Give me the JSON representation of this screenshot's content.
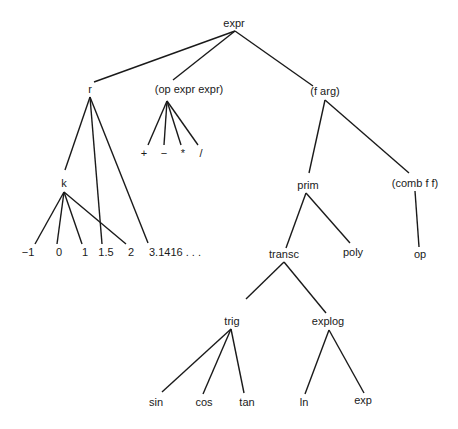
{
  "diagram": {
    "type": "tree",
    "nodes": [
      {
        "id": "expr",
        "label": "expr",
        "x": 234,
        "y": 27
      },
      {
        "id": "r",
        "label": "r",
        "x": 90,
        "y": 93
      },
      {
        "id": "opexpr",
        "label": "(op expr expr)",
        "x": 189,
        "y": 93
      },
      {
        "id": "farg",
        "label": "(f arg)",
        "x": 325,
        "y": 95
      },
      {
        "id": "plus",
        "label": "+",
        "x": 144,
        "y": 157
      },
      {
        "id": "minus",
        "label": "−",
        "x": 164,
        "y": 157
      },
      {
        "id": "times",
        "label": "*",
        "x": 183,
        "y": 157
      },
      {
        "id": "div",
        "label": "/",
        "x": 201,
        "y": 157
      },
      {
        "id": "k",
        "label": "k",
        "x": 64,
        "y": 187
      },
      {
        "id": "prim",
        "label": "prim",
        "x": 308,
        "y": 189
      },
      {
        "id": "combff",
        "label": "(comb f f)",
        "x": 415,
        "y": 187
      },
      {
        "id": "n_m1",
        "label": "−1",
        "x": 28,
        "y": 256
      },
      {
        "id": "n_0",
        "label": "0",
        "x": 59,
        "y": 256
      },
      {
        "id": "n_1",
        "label": "1",
        "x": 85,
        "y": 256
      },
      {
        "id": "n_15",
        "label": "1.5",
        "x": 106,
        "y": 256
      },
      {
        "id": "n_2",
        "label": "2",
        "x": 131,
        "y": 256
      },
      {
        "id": "n_pi",
        "label": "3.1416 . . .",
        "x": 175,
        "y": 256
      },
      {
        "id": "transc",
        "label": "transc",
        "x": 284,
        "y": 258
      },
      {
        "id": "poly",
        "label": "poly",
        "x": 353,
        "y": 256
      },
      {
        "id": "op",
        "label": "op",
        "x": 420,
        "y": 258
      },
      {
        "id": "trig",
        "label": "trig",
        "x": 232,
        "y": 325
      },
      {
        "id": "explog",
        "label": "explog",
        "x": 328,
        "y": 325
      },
      {
        "id": "sin",
        "label": "sin",
        "x": 156,
        "y": 406
      },
      {
        "id": "cos",
        "label": "cos",
        "x": 204,
        "y": 406
      },
      {
        "id": "tan",
        "label": "tan",
        "x": 247,
        "y": 406
      },
      {
        "id": "ln",
        "label": "ln",
        "x": 304,
        "y": 406
      },
      {
        "id": "exp",
        "label": "exp",
        "x": 363,
        "y": 404
      }
    ],
    "edges": [
      {
        "x1": 235,
        "y1": 31,
        "x2": 94,
        "y2": 82
      },
      {
        "x1": 235,
        "y1": 31,
        "x2": 173,
        "y2": 80
      },
      {
        "x1": 235,
        "y1": 31,
        "x2": 313,
        "y2": 86
      },
      {
        "x1": 90,
        "y1": 97,
        "x2": 65,
        "y2": 170
      },
      {
        "x1": 90,
        "y1": 97,
        "x2": 102,
        "y2": 244
      },
      {
        "x1": 90,
        "y1": 97,
        "x2": 148,
        "y2": 243
      },
      {
        "x1": 167,
        "y1": 101,
        "x2": 148,
        "y2": 145
      },
      {
        "x1": 167,
        "y1": 101,
        "x2": 164,
        "y2": 145
      },
      {
        "x1": 167,
        "y1": 101,
        "x2": 181,
        "y2": 145
      },
      {
        "x1": 167,
        "y1": 101,
        "x2": 198,
        "y2": 145
      },
      {
        "x1": 325,
        "y1": 100,
        "x2": 309,
        "y2": 173
      },
      {
        "x1": 325,
        "y1": 100,
        "x2": 409,
        "y2": 173
      },
      {
        "x1": 64,
        "y1": 192,
        "x2": 35,
        "y2": 244
      },
      {
        "x1": 64,
        "y1": 192,
        "x2": 57,
        "y2": 244
      },
      {
        "x1": 64,
        "y1": 192,
        "x2": 82,
        "y2": 244
      },
      {
        "x1": 64,
        "y1": 192,
        "x2": 126,
        "y2": 244
      },
      {
        "x1": 306,
        "y1": 193,
        "x2": 286,
        "y2": 248
      },
      {
        "x1": 306,
        "y1": 193,
        "x2": 350,
        "y2": 243
      },
      {
        "x1": 415,
        "y1": 191,
        "x2": 419,
        "y2": 247
      },
      {
        "x1": 284,
        "y1": 262,
        "x2": 246,
        "y2": 299
      },
      {
        "x1": 284,
        "y1": 262,
        "x2": 326,
        "y2": 313
      },
      {
        "x1": 231,
        "y1": 329,
        "x2": 162,
        "y2": 392
      },
      {
        "x1": 231,
        "y1": 329,
        "x2": 203,
        "y2": 394
      },
      {
        "x1": 231,
        "y1": 329,
        "x2": 244,
        "y2": 393
      },
      {
        "x1": 329,
        "y1": 330,
        "x2": 305,
        "y2": 394
      },
      {
        "x1": 329,
        "y1": 330,
        "x2": 364,
        "y2": 393
      }
    ]
  }
}
